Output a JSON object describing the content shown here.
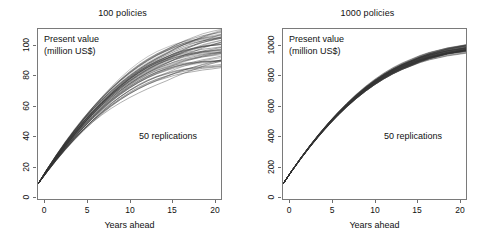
{
  "figure": {
    "background": "#ffffff",
    "line_color": "#333333",
    "axis_color": "#6e6e6e"
  },
  "panels": [
    {
      "id": "panel-100-policies",
      "title": "100 policies",
      "value_label_line1": "Present value",
      "value_label_line2": "(million US$)",
      "annotation": "50 replications",
      "xlabel": "Years ahead",
      "xticks": [
        "0",
        "5",
        "10",
        "15",
        "20"
      ],
      "yticks": [
        "0",
        "20",
        "40",
        "60",
        "80",
        "100"
      ]
    },
    {
      "id": "panel-1000-policies",
      "title": "1000 policies",
      "value_label_line1": "Present value",
      "value_label_line2": "(million US$)",
      "annotation": "50 replications",
      "xlabel": "Years ahead",
      "xticks": [
        "0",
        "5",
        "10",
        "15",
        "20"
      ],
      "yticks": [
        "0",
        "200",
        "400",
        "600",
        "800",
        "1000"
      ]
    }
  ],
  "chart_data": [
    {
      "type": "line",
      "title": "100 policies",
      "xlabel": "Years ahead",
      "ylabel": "Present value (million US$)",
      "xlim": [
        0,
        20
      ],
      "ylim": [
        0,
        113
      ],
      "xticks": [
        0,
        5,
        10,
        15,
        20
      ],
      "yticks": [
        0,
        20,
        40,
        60,
        80,
        100
      ],
      "grid": false,
      "legend": "none",
      "annotations": [
        "Present value",
        "(million US$)",
        "50 replications"
      ],
      "n_replications": 50,
      "x": [
        0,
        1,
        2,
        3,
        4,
        5,
        6,
        7,
        8,
        9,
        10,
        11,
        12,
        13,
        14,
        15,
        16,
        17,
        18,
        19,
        20
      ],
      "mean_curve": [
        10,
        19,
        27.5,
        35.5,
        43,
        50,
        56.5,
        62.5,
        68,
        73,
        77.5,
        81.5,
        85,
        88,
        90.5,
        93,
        95,
        96.5,
        98,
        99,
        100
      ],
      "spread_at_year20": [
        88,
        112
      ],
      "spread_at_year10": [
        74,
        81
      ],
      "spread_at_year5": [
        48,
        52
      ],
      "start_value": 10,
      "description": "50 simulated present-value paths fanning out with visible dispersion; terminal values span roughly 88 to 112 million US$ around a mean near 100."
    },
    {
      "type": "line",
      "title": "1000 policies",
      "xlabel": "Years ahead",
      "ylabel": "Present value (million US$)",
      "xlim": [
        0,
        20
      ],
      "ylim": [
        0,
        1130
      ],
      "xticks": [
        0,
        5,
        10,
        15,
        20
      ],
      "yticks": [
        0,
        200,
        400,
        600,
        800,
        1000
      ],
      "grid": false,
      "legend": "none",
      "annotations": [
        "Present value",
        "(million US$)",
        "50 replications"
      ],
      "n_replications": 50,
      "x": [
        0,
        1,
        2,
        3,
        4,
        5,
        6,
        7,
        8,
        9,
        10,
        11,
        12,
        13,
        14,
        15,
        16,
        17,
        18,
        19,
        20
      ],
      "mean_curve": [
        100,
        190,
        275,
        355,
        430,
        500,
        565,
        625,
        680,
        730,
        775,
        815,
        850,
        880,
        905,
        930,
        950,
        965,
        980,
        990,
        1000
      ],
      "spread_at_year20": [
        975,
        1025
      ],
      "spread_at_year10": [
        765,
        785
      ],
      "spread_at_year5": [
        494,
        506
      ],
      "start_value": 100,
      "description": "50 simulated present-value paths that stay tightly bunched; terminal values cluster near 1000 million US$ with only a narrow band of dispersion."
    }
  ]
}
